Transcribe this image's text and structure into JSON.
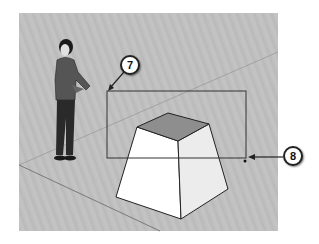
{
  "scene": {
    "description": "SketchUp-style 3D modeling viewport showing a window selection",
    "background_color": "#c0c0c0",
    "objects": [
      {
        "name": "scale-figure",
        "type": "person"
      },
      {
        "name": "frustum",
        "type": "truncated pyramid"
      }
    ],
    "selection_box": {
      "left": 107,
      "top": 91,
      "right": 246,
      "bottom": 158
    }
  },
  "callouts": [
    {
      "number": "7",
      "points_to": "selection start corner"
    },
    {
      "number": "8",
      "points_to": "selection end corner"
    }
  ]
}
